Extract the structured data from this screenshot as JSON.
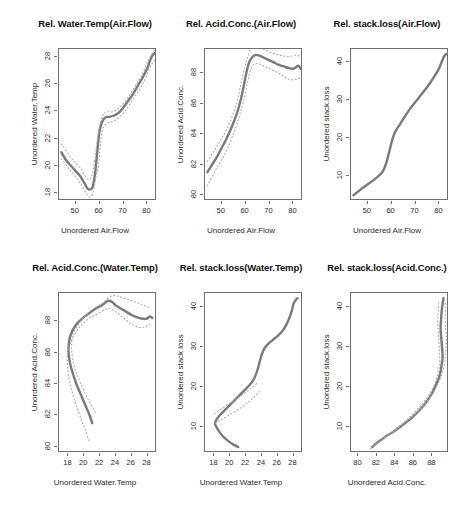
{
  "figure": {
    "width": 476,
    "height": 514,
    "background": "#ffffff",
    "curve_color": "#7a7a7a",
    "band_color": "#a8a8a8",
    "axis_color": "#6e6e6e",
    "rows": 2,
    "cols": 3
  },
  "chart_data": [
    {
      "type": "line",
      "id": "panel-1",
      "title": "Rel. Water.Temp(Air.Flow)",
      "xlabel": "Unordered Air.Flow",
      "ylabel": "Unordered Water.Temp",
      "xlim": [
        43,
        84
      ],
      "ylim": [
        17.4,
        28.6
      ],
      "xticks": [
        50,
        60,
        70,
        80
      ],
      "yticks": [
        18,
        20,
        22,
        24,
        26,
        28
      ],
      "grid": false,
      "legend": "none",
      "series": [
        {
          "name": "transform",
          "style": "solid",
          "x": [
            44,
            46,
            48,
            50,
            52,
            53,
            54,
            55,
            56,
            57,
            58,
            58.5,
            59,
            59.5,
            60,
            61,
            62,
            63,
            64,
            66,
            68,
            70,
            72,
            74,
            76,
            78,
            80,
            81,
            82,
            83
          ],
          "y": [
            21.0,
            20.4,
            20.0,
            19.6,
            19.2,
            18.9,
            18.6,
            18.3,
            18.25,
            18.4,
            19.3,
            20.1,
            21.0,
            21.9,
            22.6,
            23.2,
            23.5,
            23.6,
            23.6,
            23.7,
            23.9,
            24.3,
            24.8,
            25.3,
            25.9,
            26.5,
            27.2,
            27.7,
            28.1,
            28.3
          ]
        },
        {
          "name": "upper-band",
          "style": "dotted",
          "x": [
            44,
            48,
            52,
            55,
            57,
            58.5,
            59.5,
            61,
            63,
            66,
            70,
            74,
            78,
            81,
            83
          ],
          "y": [
            21.6,
            20.6,
            19.8,
            19.0,
            19.4,
            21.2,
            22.5,
            23.6,
            24.0,
            24.0,
            24.6,
            25.6,
            26.8,
            28.0,
            28.5
          ]
        },
        {
          "name": "lower-band",
          "style": "dotted",
          "x": [
            44,
            48,
            52,
            55,
            57,
            58.5,
            59.5,
            61,
            63,
            66,
            70,
            74,
            78,
            81,
            83
          ],
          "y": [
            20.5,
            19.6,
            18.7,
            17.8,
            17.9,
            19.2,
            20.0,
            22.5,
            23.1,
            23.3,
            23.9,
            24.9,
            26.0,
            27.2,
            27.8
          ]
        }
      ]
    },
    {
      "type": "line",
      "id": "panel-2",
      "title": "Rel. Acid.Conc.(Air.Flow)",
      "xlabel": "Unordered Air.Flow",
      "ylabel": "Unordered Acid.Conc.",
      "xlim": [
        43,
        84
      ],
      "ylim": [
        79.6,
        89.6
      ],
      "xticks": [
        50,
        60,
        70,
        80
      ],
      "yticks": [
        80,
        82,
        84,
        86,
        88
      ],
      "grid": false,
      "legend": "none",
      "series": [
        {
          "name": "transform",
          "style": "solid",
          "x": [
            44,
            46,
            48,
            50,
            52,
            54,
            56,
            57,
            58,
            59,
            60,
            61,
            62,
            63,
            64,
            65,
            66,
            68,
            70,
            72,
            74,
            76,
            78,
            80,
            81,
            82,
            83
          ],
          "y": [
            81.5,
            82.0,
            82.5,
            83.1,
            83.7,
            84.4,
            85.2,
            85.7,
            86.3,
            87.0,
            87.8,
            88.5,
            88.9,
            89.1,
            89.2,
            89.2,
            89.15,
            89.0,
            88.85,
            88.7,
            88.55,
            88.45,
            88.35,
            88.3,
            88.4,
            88.5,
            88.3
          ]
        },
        {
          "name": "upper-band",
          "style": "dotted",
          "x": [
            44,
            48,
            52,
            56,
            59,
            62,
            64,
            66,
            70,
            74,
            78,
            81,
            83
          ],
          "y": [
            82.2,
            83.2,
            84.3,
            85.9,
            88.0,
            89.6,
            89.8,
            89.7,
            89.4,
            89.2,
            89.1,
            89.2,
            89.1
          ]
        },
        {
          "name": "lower-band",
          "style": "dotted",
          "x": [
            44,
            48,
            52,
            56,
            59,
            62,
            64,
            66,
            70,
            74,
            78,
            81,
            83
          ],
          "y": [
            80.6,
            81.8,
            82.9,
            84.5,
            86.1,
            88.2,
            88.6,
            88.6,
            88.3,
            88.0,
            87.6,
            87.6,
            87.7
          ]
        }
      ]
    },
    {
      "type": "line",
      "id": "panel-3",
      "title": "Rel. stack.loss(Air.Flow)",
      "xlabel": "Unordered Air.Flow",
      "ylabel": "Unordered stack.loss",
      "xlim": [
        43,
        84
      ],
      "ylim": [
        3.5,
        43.5
      ],
      "xticks": [
        50,
        60,
        70,
        80
      ],
      "yticks": [
        10,
        20,
        30,
        40
      ],
      "grid": false,
      "legend": "none",
      "series": [
        {
          "name": "transform",
          "style": "solid",
          "x": [
            44,
            46,
            48,
            50,
            52,
            54,
            56,
            57,
            58,
            59,
            60,
            61,
            62,
            63,
            64,
            66,
            68,
            70,
            72,
            74,
            76,
            78,
            80,
            81,
            82,
            83
          ],
          "y": [
            5.0,
            6.0,
            7.0,
            7.9,
            8.8,
            9.8,
            11.0,
            12.2,
            14.0,
            16.5,
            19.0,
            21.0,
            22.3,
            23.2,
            24.2,
            26.2,
            28.0,
            29.6,
            31.2,
            32.8,
            34.5,
            36.4,
            38.6,
            40.2,
            41.6,
            42.2
          ]
        }
      ]
    },
    {
      "type": "line",
      "id": "panel-4",
      "title": "Rel. Acid.Conc.(Water.Temp)",
      "xlabel": "Unordered Water.Temp",
      "ylabel": "Unordered Acid.Conc.",
      "xlim": [
        16.8,
        29.2
      ],
      "ylim": [
        79.6,
        89.8
      ],
      "xticks": [
        18,
        20,
        22,
        24,
        26,
        28
      ],
      "yticks": [
        80,
        82,
        84,
        86,
        88
      ],
      "grid": false,
      "legend": "none",
      "series": [
        {
          "name": "transform",
          "style": "solid",
          "x": [
            21.0,
            20.6,
            20.0,
            19.5,
            19.0,
            18.6,
            18.3,
            18.1,
            18.0,
            18.05,
            18.2,
            18.5,
            19.0,
            19.8,
            20.6,
            21.4,
            22.2,
            23.0,
            23.6,
            24.0,
            25.0,
            26.0,
            27.0,
            27.8,
            28.3,
            28.6
          ],
          "y": [
            81.5,
            82.1,
            82.8,
            83.4,
            84.0,
            84.6,
            85.1,
            85.6,
            86.1,
            86.6,
            87.0,
            87.4,
            87.8,
            88.2,
            88.5,
            88.8,
            89.0,
            89.3,
            89.2,
            89.0,
            88.7,
            88.4,
            88.2,
            88.15,
            88.3,
            88.2
          ]
        },
        {
          "name": "upper-band",
          "style": "dotted",
          "x": [
            21.4,
            20.4,
            19.4,
            18.7,
            18.4,
            18.5,
            19.0,
            20.0,
            21.2,
            22.4,
            23.4,
            24.2,
            25.4,
            26.6,
            27.6,
            28.4
          ],
          "y": [
            82.2,
            83.1,
            84.2,
            85.2,
            86.2,
            87.0,
            87.6,
            88.3,
            88.8,
            89.2,
            89.6,
            89.6,
            89.4,
            89.2,
            89.0,
            88.8
          ]
        },
        {
          "name": "lower-band",
          "style": "dotted",
          "x": [
            20.6,
            19.8,
            19.0,
            18.3,
            17.9,
            17.9,
            18.3,
            19.2,
            20.4,
            21.8,
            23.0,
            24.0,
            25.2,
            26.4,
            27.4,
            28.3
          ],
          "y": [
            80.4,
            81.5,
            82.6,
            83.8,
            85.0,
            86.0,
            86.7,
            87.5,
            88.1,
            88.5,
            88.8,
            88.6,
            88.1,
            87.7,
            87.6,
            87.8
          ]
        }
      ]
    },
    {
      "type": "line",
      "id": "panel-5",
      "title": "Rel. stack.loss(Water.Temp)",
      "xlabel": "Unordered Water.Temp",
      "ylabel": "Unordered stack.loss",
      "xlim": [
        16.8,
        29.2
      ],
      "ylim": [
        3.5,
        43.5
      ],
      "xticks": [
        18,
        20,
        22,
        24,
        26,
        28
      ],
      "yticks": [
        10,
        20,
        30,
        40
      ],
      "grid": false,
      "legend": "none",
      "series": [
        {
          "name": "transform",
          "style": "solid",
          "x": [
            21.0,
            20.4,
            19.8,
            19.2,
            18.7,
            18.3,
            18.1,
            18.1,
            18.3,
            18.7,
            19.4,
            20.2,
            21.0,
            21.8,
            22.5,
            23.0,
            23.4,
            23.7,
            24.0,
            24.3,
            24.8,
            25.4,
            26.0,
            26.6,
            27.1,
            27.5,
            27.8,
            28.0,
            28.3,
            28.5
          ],
          "y": [
            5.0,
            5.6,
            6.4,
            7.4,
            8.6,
            9.8,
            10.6,
            11.2,
            12.0,
            13.0,
            14.4,
            16.0,
            17.6,
            19.2,
            20.6,
            22.0,
            24.0,
            26.2,
            28.2,
            29.6,
            30.8,
            31.8,
            32.8,
            34.0,
            35.6,
            37.4,
            39.2,
            40.8,
            41.8,
            42.2
          ]
        },
        {
          "name": "upper-band",
          "style": "dotted",
          "x": [
            18.0,
            18.6,
            19.4,
            20.3,
            21.2,
            22.0,
            22.8,
            23.4
          ],
          "y": [
            13.4,
            14.2,
            15.2,
            16.4,
            17.6,
            18.8,
            20.0,
            21.0
          ]
        },
        {
          "name": "lower-band",
          "style": "dotted",
          "x": [
            18.1,
            18.8,
            19.7,
            20.7,
            21.6,
            22.4,
            23.1,
            23.7
          ],
          "y": [
            11.0,
            11.8,
            12.8,
            14.0,
            15.2,
            16.4,
            17.6,
            18.8
          ]
        }
      ]
    },
    {
      "type": "line",
      "id": "panel-6",
      "title": "Rel. stack.loss(Acid.Conc.)",
      "xlabel": "Unordered Acid.Conc.",
      "ylabel": "Unordered stack.loss",
      "xlim": [
        79.2,
        89.8
      ],
      "ylim": [
        3.5,
        43.5
      ],
      "xticks": [
        80,
        82,
        84,
        86,
        88
      ],
      "yticks": [
        10,
        20,
        30,
        40
      ],
      "grid": false,
      "legend": "none",
      "series": [
        {
          "name": "transform",
          "style": "solid",
          "x": [
            81.5,
            82.0,
            82.6,
            83.2,
            83.9,
            84.6,
            85.3,
            86.0,
            86.6,
            87.2,
            87.7,
            88.1,
            88.4,
            88.7,
            88.9,
            89.0,
            89.1,
            89.1,
            89.05,
            89.0,
            88.95,
            88.9,
            88.9,
            88.95,
            89.0,
            89.1,
            89.2
          ],
          "y": [
            5.0,
            6.0,
            7.0,
            8.0,
            9.0,
            10.2,
            11.4,
            12.8,
            14.2,
            15.8,
            17.4,
            19.0,
            20.6,
            22.2,
            24.0,
            25.6,
            27.0,
            28.4,
            29.8,
            31.2,
            32.6,
            34.0,
            35.4,
            37.0,
            38.8,
            40.6,
            42.2
          ]
        },
        {
          "name": "upper-band",
          "style": "dotted",
          "x": [
            81.8,
            83.0,
            84.2,
            85.4,
            86.5,
            87.4,
            88.2,
            88.8,
            89.2,
            89.4,
            89.5,
            89.5,
            89.4,
            89.4,
            89.4
          ],
          "y": [
            5.6,
            7.6,
            9.6,
            11.8,
            14.0,
            16.4,
            19.0,
            21.8,
            24.6,
            27.4,
            30.2,
            33.0,
            35.8,
            38.6,
            41.4
          ]
        },
        {
          "name": "lower-band",
          "style": "dotted",
          "x": [
            81.3,
            82.4,
            83.4,
            84.5,
            85.6,
            86.6,
            87.5,
            88.2,
            88.6,
            88.8,
            88.75,
            88.7,
            88.6,
            88.6,
            88.7
          ],
          "y": [
            4.6,
            6.4,
            8.4,
            10.4,
            12.6,
            15.0,
            17.6,
            20.4,
            23.4,
            26.4,
            29.2,
            32.0,
            34.8,
            37.8,
            41.0
          ]
        }
      ]
    }
  ]
}
